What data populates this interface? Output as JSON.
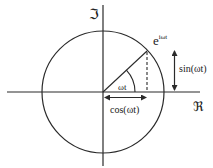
{
  "diagram": {
    "axes": {
      "imaginary_label": "ℑ",
      "real_label": "ℜ"
    },
    "labels": {
      "phasor_base": "e",
      "phasor_exponent": "iωt",
      "angle": "ωt",
      "sine": "sin(ωt)",
      "cosine": "cos(ωt)"
    },
    "colors": {
      "stroke": "#2a2a2a",
      "background": "#ffffff"
    }
  }
}
